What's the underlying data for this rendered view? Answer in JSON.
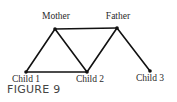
{
  "figure": {
    "caption": "FIGURE 9",
    "nodes": [
      {
        "id": "mother",
        "label": "Mother",
        "x": 55,
        "y": 29,
        "lx": 56,
        "ly": 19
      },
      {
        "id": "father",
        "label": "Father",
        "x": 117,
        "y": 28,
        "lx": 118,
        "ly": 19
      },
      {
        "id": "child1",
        "label": "Child 1",
        "x": 26,
        "y": 72,
        "lx": 26,
        "ly": 82
      },
      {
        "id": "child2",
        "label": "Child 2",
        "x": 87,
        "y": 72,
        "lx": 90,
        "ly": 82
      },
      {
        "id": "child3",
        "label": "Child 3",
        "x": 150,
        "y": 71,
        "lx": 150,
        "ly": 81
      }
    ],
    "edges": [
      [
        "mother",
        "father"
      ],
      [
        "mother",
        "child1"
      ],
      [
        "mother",
        "child2"
      ],
      [
        "father",
        "child2"
      ],
      [
        "father",
        "child3"
      ],
      [
        "child1",
        "child2"
      ]
    ],
    "colors": {
      "line": "#111111",
      "node": "#111111"
    }
  }
}
